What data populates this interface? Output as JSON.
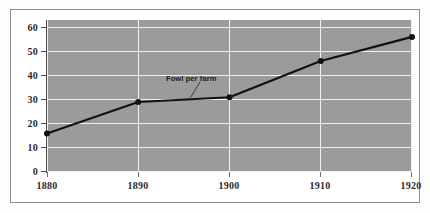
{
  "chart_data": {
    "type": "line",
    "title": "",
    "subtitle": "",
    "xlabel": "",
    "ylabel": "",
    "x": [
      1880,
      1890,
      1900,
      1910,
      1920
    ],
    "categories": [
      "1880",
      "1890",
      "1900",
      "1910",
      "1920"
    ],
    "series": [
      {
        "name": "Fowl per farm",
        "values": [
          16,
          29,
          31,
          46,
          56
        ]
      }
    ],
    "xlim": [
      1880,
      1920
    ],
    "ylim": [
      0,
      63
    ],
    "y_ticks": [
      0,
      10,
      20,
      30,
      40,
      50,
      60
    ],
    "y_tick_labels": [
      "0",
      "10",
      "20",
      "30",
      "40",
      "50",
      "60"
    ],
    "x_ticks": [
      1880,
      1890,
      1900,
      1910,
      1920
    ],
    "x_tick_labels": [
      "1880",
      "1890",
      "1900",
      "1910",
      "1920"
    ],
    "grid": true,
    "grid_orientation": "both",
    "legend": false,
    "legend_position": "none",
    "annotations": [
      {
        "text": "Fowl per farm",
        "points_to_x": 1895,
        "points_to_y": 30
      }
    ],
    "colors": {
      "plot_background": "#9b9b9b",
      "gridline": "#f0f0f0",
      "series_line": "#111111",
      "marker": "#111111",
      "axis": "#4a4a4a",
      "tick_label": "#2b2b2b",
      "annotation_text": "#1a1a1a",
      "frame_border": "#8f8f8f",
      "figure_background": "#fdfdfd"
    }
  }
}
